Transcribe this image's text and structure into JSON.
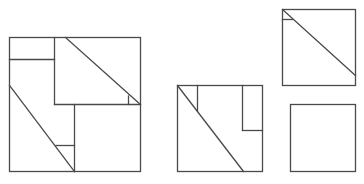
{
  "diagram": {
    "stroke_color": "#4a4a4a",
    "background": "#ffffff",
    "shapes": {
      "large_square": {
        "x": 9,
        "y": 37,
        "w": 131,
        "h": 134
      },
      "middle_square": {
        "x": 177,
        "y": 85,
        "w": 86,
        "h": 86
      },
      "top_right_square": {
        "x": 282,
        "y": 9,
        "w": 74,
        "h": 77
      },
      "bottom_right_square": {
        "x": 290,
        "y": 104,
        "w": 66,
        "h": 67
      }
    }
  }
}
